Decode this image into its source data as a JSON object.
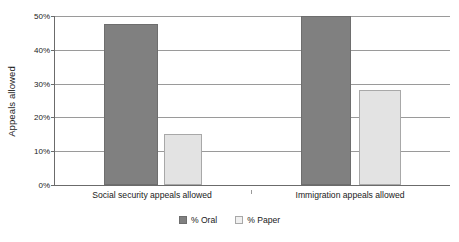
{
  "chart_data": {
    "type": "bar",
    "title": "",
    "subtitle": "",
    "xlabel": "",
    "ylabel": "Appeals allowed",
    "ylim": [
      0,
      50
    ],
    "ytick_values": [
      0,
      10,
      20,
      30,
      40,
      50
    ],
    "ytick_labels": [
      "0%",
      "10%",
      "20%",
      "30%",
      "40%",
      "50%"
    ],
    "grid": true,
    "legend_position": "bottom",
    "categories": [
      "Social security appeals allowed",
      "Immigration appeals allowed"
    ],
    "series": [
      {
        "name": "% Oral",
        "color": "#808080",
        "values": [
          47.5,
          50
        ]
      },
      {
        "name": "% Paper",
        "color": "#e3e3e3",
        "values": [
          15,
          28
        ]
      }
    ]
  },
  "axis": {
    "y_title": "Appeals allowed",
    "ticks": [
      {
        "label": "50%",
        "value": 50
      },
      {
        "label": "40%",
        "value": 40
      },
      {
        "label": "30%",
        "value": 30
      },
      {
        "label": "20%",
        "value": 20
      },
      {
        "label": "10%",
        "value": 10
      },
      {
        "label": "0%",
        "value": 0
      }
    ]
  },
  "categories": [
    {
      "label": "Social security appeals allowed"
    },
    {
      "label": "Immigration appeals allowed"
    }
  ],
  "legend": {
    "items": [
      {
        "label": "% Oral",
        "color": "#808080"
      },
      {
        "label": "% Paper",
        "color": "#e3e3e3"
      }
    ]
  },
  "colors": {
    "oral": "#808080",
    "paper": "#e3e3e3",
    "gridline": "#9a9a9a",
    "axis": "#6b6b6b",
    "background": "#ffffff",
    "text": "#1a1a1a"
  }
}
